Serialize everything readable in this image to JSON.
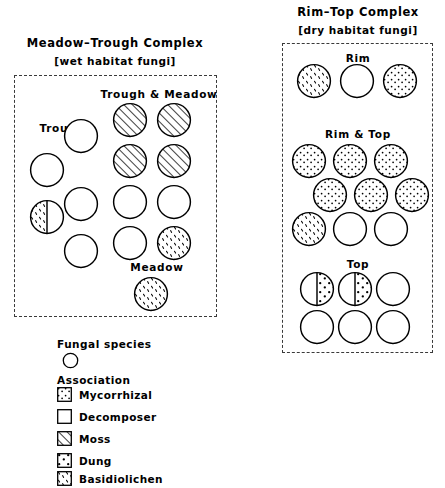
{
  "figure": {
    "complexes": [
      {
        "id": "meadow-trough",
        "title": "Meadow–Trough  Complex",
        "subtitle": "[wet habitat fungi]",
        "groups": [
          {
            "id": "trough",
            "label": "Trough",
            "circles": [
              {
                "fill": "decomposer"
              },
              {
                "fill": "decomposer"
              },
              {
                "fill": "decomposer"
              },
              {
                "fill": "split-basidiolichen-left"
              },
              {
                "fill": "decomposer"
              }
            ]
          },
          {
            "id": "trough-and-meadow",
            "label": "Trough & Meadow",
            "circles": [
              {
                "fill": "moss"
              },
              {
                "fill": "moss"
              },
              {
                "fill": "moss"
              },
              {
                "fill": "moss"
              },
              {
                "fill": "decomposer"
              },
              {
                "fill": "decomposer"
              },
              {
                "fill": "decomposer"
              },
              {
                "fill": "basidiolichen"
              }
            ]
          },
          {
            "id": "meadow",
            "label": "Meadow",
            "circles": [
              {
                "fill": "basidiolichen"
              }
            ]
          }
        ]
      },
      {
        "id": "rim-top",
        "title": "Rim–Top  Complex",
        "subtitle": "[dry habitat fungi]",
        "groups": [
          {
            "id": "rim",
            "label": "Rim",
            "circles": [
              {
                "fill": "basidiolichen"
              },
              {
                "fill": "decomposer"
              },
              {
                "fill": "mycorrhizal"
              }
            ]
          },
          {
            "id": "rim-and-top",
            "label": "Rim & Top",
            "circles": [
              {
                "fill": "mycorrhizal"
              },
              {
                "fill": "mycorrhizal"
              },
              {
                "fill": "mycorrhizal"
              },
              {
                "fill": "mycorrhizal"
              },
              {
                "fill": "mycorrhizal"
              },
              {
                "fill": "mycorrhizal"
              },
              {
                "fill": "basidiolichen"
              },
              {
                "fill": "decomposer"
              },
              {
                "fill": "decomposer"
              }
            ]
          },
          {
            "id": "top",
            "label": "Top",
            "circles": [
              {
                "fill": "split-dung-right"
              },
              {
                "fill": "split-dung-right"
              },
              {
                "fill": "decomposer"
              },
              {
                "fill": "decomposer"
              },
              {
                "fill": "decomposer"
              },
              {
                "fill": "decomposer"
              }
            ]
          }
        ]
      }
    ]
  },
  "legend": {
    "species_heading": "Fungal species",
    "species_symbol": "circle-outline",
    "association_heading": "Association",
    "items": [
      {
        "key": "mycorrhizal",
        "label": "Mycorrhizal",
        "swatch": "grid-dot-pattern"
      },
      {
        "key": "decomposer",
        "label": "Decomposer",
        "swatch": "empty-pattern"
      },
      {
        "key": "moss",
        "label": "Moss",
        "swatch": "diagonal-hatch-pattern"
      },
      {
        "key": "dung",
        "label": "Dung",
        "swatch": "sparse-dot-pattern"
      },
      {
        "key": "basidiolichen",
        "label": "Basidiolichen",
        "swatch": "fleck-pattern"
      }
    ]
  },
  "style": {
    "ink": "#000000",
    "panel_border": "#3a3a3a",
    "background": "#ffffff"
  }
}
